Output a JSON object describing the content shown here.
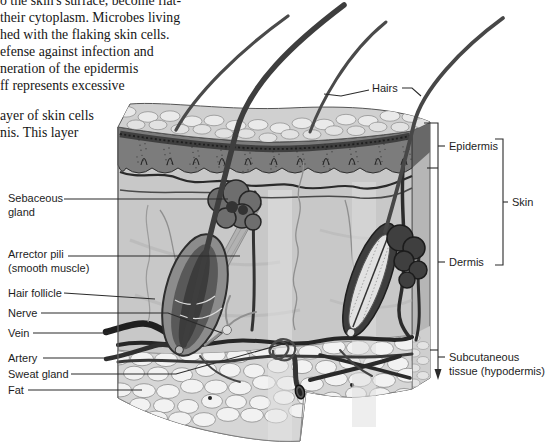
{
  "page": {
    "background": "#ffffff",
    "text_color": "#161616",
    "label_color": "#1d1d1d",
    "line_color": "#2b2b2b"
  },
  "paragraph": {
    "lines": [
      "o the skin's surface, become flat-",
      "their cytoplasm. Microbes living",
      "hed with the flaking skin cells.",
      "efense against infection and",
      "neration of the epidermis",
      "ff represents excessive",
      "ayer of skin cells",
      "nis. This layer"
    ]
  },
  "figure": {
    "labels_left": [
      {
        "line1": "Sebaceous",
        "line2": "gland"
      },
      {
        "line1": "Arrector pili",
        "line2": "(smooth muscle)"
      },
      {
        "line1": "Hair follicle"
      },
      {
        "line1": "Nerve"
      },
      {
        "line1": "Vein"
      },
      {
        "line1": "Artery"
      },
      {
        "line1": "Sweat gland"
      },
      {
        "line1": "Fat"
      }
    ],
    "labels_right": {
      "hairs": "Hairs",
      "epidermis": "Epidermis",
      "skin": "Skin",
      "dermis": "Dermis",
      "subcutaneous_line1": "Subcutaneous",
      "subcutaneous_line2": "tissue (hypodermis)"
    }
  }
}
